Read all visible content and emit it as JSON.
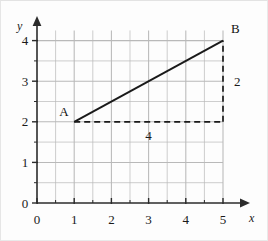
{
  "chart_data": {
    "type": "line",
    "title": "",
    "xlabel": "x",
    "ylabel": "y",
    "xlim": [
      0,
      5.45
    ],
    "ylim": [
      0,
      4.55
    ],
    "grid": true,
    "grid_step": 0.5,
    "grid_x_range": [
      0.5,
      5.0
    ],
    "grid_y_range": [
      0.5,
      4.25
    ],
    "legend": "none",
    "x_ticks": [
      "0",
      "1",
      "2",
      "3",
      "4",
      "5"
    ],
    "x_tick_values": [
      0,
      1,
      2,
      3,
      4,
      5
    ],
    "y_ticks": [
      "0",
      "1",
      "2",
      "3",
      "4"
    ],
    "y_tick_values": [
      0,
      1,
      2,
      3,
      4
    ],
    "minor_tick_step": 0.5,
    "series": [
      {
        "name": "segment-AB",
        "style": "solid",
        "points": [
          [
            1,
            2
          ],
          [
            5,
            4
          ]
        ],
        "slope": 0.5
      },
      {
        "name": "run-guide",
        "style": "dashed",
        "points": [
          [
            1,
            2
          ],
          [
            5,
            2
          ]
        ]
      },
      {
        "name": "rise-guide",
        "style": "dashed",
        "points": [
          [
            5,
            2
          ],
          [
            5,
            4
          ]
        ]
      }
    ],
    "annotations": [
      {
        "name": "point-a-label",
        "text": "A",
        "x": 1,
        "y": 2,
        "anchor": "upper-left"
      },
      {
        "name": "point-b-label",
        "text": "B",
        "x": 5,
        "y": 4,
        "anchor": "upper-right"
      },
      {
        "name": "run-label",
        "text": "4",
        "x": 3,
        "y": 2,
        "anchor": "below"
      },
      {
        "name": "rise-label",
        "text": "2",
        "x": 5,
        "y": 3,
        "anchor": "right"
      }
    ]
  },
  "colors": {
    "background": "#fdfdfd",
    "grid": "#b9b9b9",
    "axis": "#2b2b2b",
    "line": "#1a1a1a",
    "text": "#1a1a1a",
    "frame": "#e9e9e9"
  },
  "axes": {
    "x_axis_name": "x",
    "y_axis_name": "y",
    "origin_label": "0"
  }
}
